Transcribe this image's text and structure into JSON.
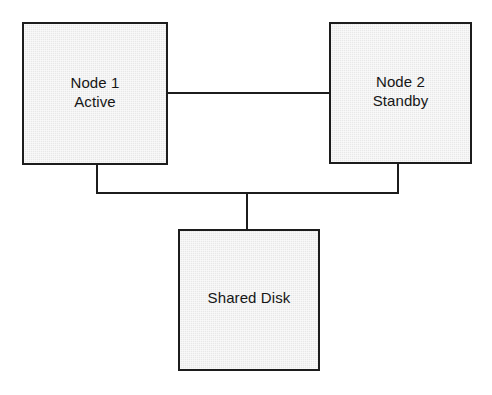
{
  "diagram": {
    "type": "block-diagram",
    "background_color": "#ffffff",
    "box_fill_color": "#e8e8e8",
    "box_border_color": "#1c1c1c",
    "connector_color": "#1c1c1c",
    "text_color": "#161616"
  },
  "nodes": [
    {
      "id": "node-1",
      "name": "Node 1",
      "role": "Active",
      "lines": [
        "Node 1",
        "Active"
      ],
      "x": 22,
      "y": 22,
      "width": 146,
      "height": 143
    },
    {
      "id": "node-2",
      "name": "Node 2",
      "role": "Standby",
      "lines": [
        "Node 2",
        "Standby"
      ],
      "x": 329,
      "y": 22,
      "width": 143,
      "height": 142
    },
    {
      "id": "shared-disk",
      "name": "Shared Disk",
      "role": "",
      "lines": [
        "Shared Disk"
      ],
      "x": 178,
      "y": 229,
      "width": 142,
      "height": 142
    }
  ],
  "connections": [
    {
      "id": "link-peer",
      "from": "node-1",
      "to": "node-2",
      "style": "straight"
    },
    {
      "id": "link-n1-leg",
      "from": "node-1",
      "to": "bus",
      "style": "orthogonal"
    },
    {
      "id": "link-n2-leg",
      "from": "node-2",
      "to": "bus",
      "style": "orthogonal"
    },
    {
      "id": "link-bus",
      "from": "bus",
      "to": "bus",
      "style": "orthogonal"
    },
    {
      "id": "link-disk-stem",
      "from": "bus",
      "to": "shared-disk",
      "style": "orthogonal"
    }
  ],
  "labels": {
    "node_1_line_1": "Node 1",
    "node_1_line_2": "Active",
    "node_2_line_1": "Node 2",
    "node_2_line_2": "Standby",
    "shared_disk_line_1": "Shared Disk"
  }
}
